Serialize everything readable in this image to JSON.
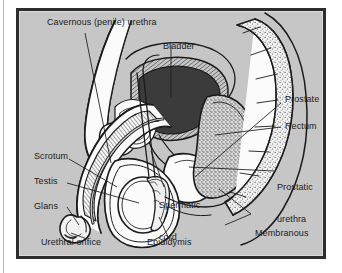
{
  "figure": {
    "kind": "anatomical-diagram",
    "background_color": "#c6c6c6",
    "frame_color": "#2d2d2d",
    "ink_color": "#1b1b1b",
    "fill_white": "#fbfbfb",
    "bladder_fill": "#3b3b3b",
    "soft_tissue_fill": "#e9e9e9"
  },
  "labels": [
    {
      "id": "cavernous-urethra",
      "text": "Cavernous (penile) urethra"
    },
    {
      "id": "bladder",
      "text": "Bladder"
    },
    {
      "id": "prostate",
      "text": "Prostate"
    },
    {
      "id": "rectum",
      "text": "Rectum"
    },
    {
      "id": "prostatic-urethra",
      "line1": "Prostatic",
      "line2": "urethra"
    },
    {
      "id": "membranous-urethra",
      "line1": "Membranous",
      "line2": "urethra"
    },
    {
      "id": "scrotum",
      "text": "Scrotum"
    },
    {
      "id": "testis",
      "text": "Testis"
    },
    {
      "id": "glans",
      "text": "Glans"
    },
    {
      "id": "urethral-orifice",
      "text": "Urethral orifice"
    },
    {
      "id": "epididymis",
      "text": "Epididymis"
    },
    {
      "id": "spermatic-cord",
      "line1": "Spermatic",
      "line2": "cord"
    }
  ]
}
